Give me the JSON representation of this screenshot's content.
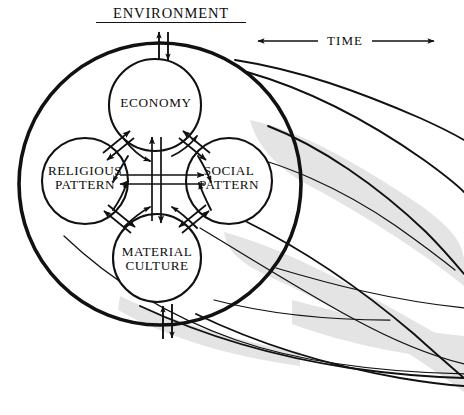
{
  "diagram": {
    "title": "ENVIRONMENT",
    "time_axis_label": "TIME",
    "nodes": [
      {
        "id": "economy",
        "label": "ECONOMY",
        "cx": 155,
        "cy": 105,
        "r": 46
      },
      {
        "id": "religious",
        "label": "RELIGIOUS\nPATTERN",
        "cx": 85,
        "cy": 181,
        "r": 43
      },
      {
        "id": "social",
        "label": "SOCIAL\nPATTERN",
        "cx": 229,
        "cy": 181,
        "r": 43
      },
      {
        "id": "material",
        "label": "MATERIAL\nCULTURE",
        "cx": 157,
        "cy": 258,
        "r": 44
      }
    ],
    "environment_boundary": {
      "cx": 160,
      "cy": 184,
      "r": 141,
      "stroke_width": 3.4
    },
    "node_line_1_economy": "ECONOMY",
    "node_line_1_religious": "RELIGIOUS",
    "node_line_2_religious": "PATTERN",
    "node_line_1_social": "SOCIAL",
    "node_line_2_social": "PATTERN",
    "node_line_1_material": "MATERIAL",
    "node_line_2_material": "CULTURE",
    "colors": {
      "ink": "#111111",
      "paper": "#ffffff",
      "shadow_band": "#e3e3e3"
    },
    "arrows": {
      "external_top": "bidirectional exchange across environment boundary (top)",
      "external_bottom": "bidirectional exchange across environment boundary (bottom)",
      "vertical_cross": "economy <-> material culture",
      "horizontal_cross": "religious pattern <-> social pattern",
      "diag_nw": "economy <-> religious pattern",
      "diag_ne": "economy <-> social pattern",
      "diag_sw": "religious pattern <-> material culture",
      "diag_se": "social pattern <-> material culture"
    },
    "time_arrow_direction": "both"
  }
}
